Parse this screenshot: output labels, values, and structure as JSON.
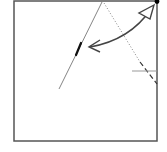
{
  "diagram": {
    "type": "origami-fold-instruction",
    "colors": {
      "paper_edge": "#555555",
      "fold_line": "#666666",
      "arrow": "#444444",
      "dot": "#000000",
      "guide_line": "#999999",
      "background": "#ffffff"
    },
    "paper": {
      "x": 14,
      "y": 1,
      "width": 143,
      "height": 140
    },
    "corner_dot": {
      "x": 157,
      "y": 1
    },
    "crease_line": {
      "x1": 102,
      "y1": 2,
      "x2": 59,
      "y2": 89
    },
    "crease_highlight": {
      "x1": 81,
      "y1": 43,
      "x2": 76,
      "y2": 55
    },
    "valley_dotted": {
      "x1": 104,
      "y1": 3,
      "x2": 140,
      "y2": 62
    },
    "valley_dashed": {
      "x1": 140,
      "y1": 62,
      "x2": 157,
      "y2": 84
    },
    "guide_tick": {
      "x1": 132,
      "y1": 71,
      "x2": 157,
      "y2": 71
    },
    "fold_arrow": {
      "direction": "two-way",
      "from": {
        "x": 89,
        "y": 47
      },
      "to": {
        "x": 153,
        "y": 7
      }
    }
  }
}
